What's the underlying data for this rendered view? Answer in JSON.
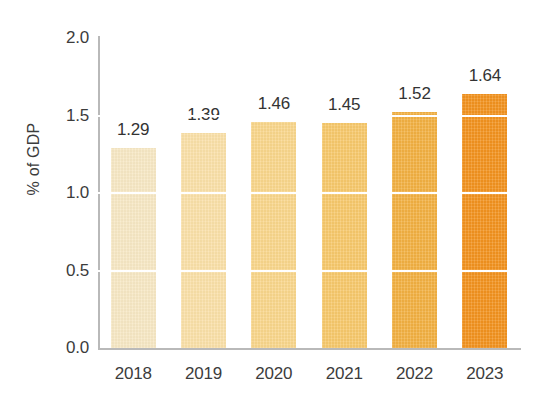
{
  "chart_data": {
    "type": "bar",
    "title": "",
    "xlabel": "",
    "ylabel": "% of GDP",
    "categories": [
      "2018",
      "2019",
      "2020",
      "2021",
      "2022",
      "2023"
    ],
    "values": [
      1.29,
      1.39,
      1.46,
      1.45,
      1.52,
      1.64
    ],
    "value_labels": [
      "1.29",
      "1.39",
      "1.46",
      "1.45",
      "1.52",
      "1.64"
    ],
    "ylim": [
      0.0,
      2.0
    ],
    "yticks": [
      0.0,
      0.5,
      1.0,
      1.5,
      2.0
    ],
    "ytick_labels": [
      "0.0",
      "0.5",
      "1.0",
      "1.5",
      "2.0"
    ],
    "gridlines": [
      0.5,
      1.0,
      1.5
    ],
    "grid": true,
    "grid_color": "#ffffff",
    "legend": null,
    "bar_colors": [
      "#F7E8C4",
      "#FAE0A8",
      "#F9D68B",
      "#F7C86B",
      "#F2B042",
      "#F2921E"
    ],
    "axis_color": "#b9b9b9",
    "text_color": "#3c3c3c",
    "background": "#ffffff"
  }
}
